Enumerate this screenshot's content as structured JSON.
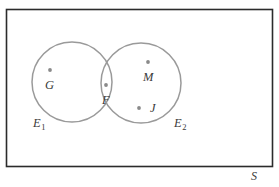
{
  "figure": {
    "type": "venn-diagram",
    "universe_label": "S",
    "rectangle": {
      "x": 6,
      "y": 9,
      "width": 266,
      "height": 157,
      "stroke": "#2b2b2b"
    },
    "circles": [
      {
        "name": "E1",
        "label": "E",
        "subscript": "1",
        "cx": 72,
        "cy": 82,
        "r": 40,
        "stroke": "#9a9a9a",
        "label_x": 33,
        "label_y": 124
      },
      {
        "name": "E2",
        "label": "E",
        "subscript": "2",
        "cx": 141,
        "cy": 83,
        "r": 40,
        "stroke": "#9a9a9a",
        "label_x": 174,
        "label_y": 124
      }
    ],
    "points": [
      {
        "name": "G",
        "label": "G",
        "dot_x": 50,
        "dot_y": 70,
        "label_x": 45,
        "label_y": 86,
        "region": "E1 only",
        "color": "#8a8a8a"
      },
      {
        "name": "F",
        "label": "F",
        "dot_x": 106,
        "dot_y": 85,
        "label_x": 102,
        "label_y": 101,
        "region": "E1 and E2 intersection",
        "color": "#8a8a8a"
      },
      {
        "name": "M",
        "label": "M",
        "dot_x": 148,
        "dot_y": 62,
        "label_x": 143,
        "label_y": 79,
        "region": "E2 only",
        "color": "#8a8a8a"
      },
      {
        "name": "J",
        "label": "J",
        "dot_x": 139,
        "dot_y": 108,
        "label_x": 150,
        "label_y": 112,
        "region": "E2 only",
        "color": "#8a8a8a"
      }
    ],
    "universe_label_x": 251,
    "universe_label_y": 172
  }
}
